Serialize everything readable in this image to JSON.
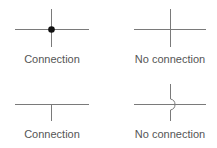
{
  "diagram": {
    "line_color": "#7a7a7a",
    "dot_color": "#111111",
    "label_color": "#555555",
    "panels": [
      {
        "id": "cross-dot",
        "label": "Connection",
        "kind": "four-way junction with dot"
      },
      {
        "id": "cross-plain",
        "label": "No connection",
        "kind": "crossing wires without dot"
      },
      {
        "id": "tee",
        "label": "Connection",
        "kind": "T junction"
      },
      {
        "id": "hop",
        "label": "No connection",
        "kind": "crossing wires with hop-over"
      }
    ]
  }
}
